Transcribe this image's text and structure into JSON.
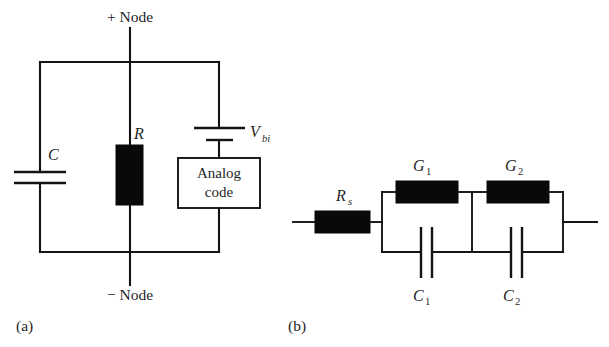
{
  "figure": {
    "subfigures": [
      {
        "id": "a",
        "label": "(a)"
      },
      {
        "id": "b",
        "label": "(b)"
      }
    ]
  },
  "circuit_a": {
    "caption": "(a)",
    "terminals": {
      "top": "+ Node",
      "bottom": "− Node"
    },
    "components": [
      {
        "name": "capacitor-c",
        "label": "C",
        "type": "capacitor",
        "orientation": "horizontal-plates"
      },
      {
        "name": "resistor-r",
        "label": "R",
        "type": "resistor",
        "style": "filled-block"
      },
      {
        "name": "source-vbi",
        "label": "V",
        "sub": "bi",
        "type": "voltage-source",
        "style": "battery"
      },
      {
        "name": "analog-code-block",
        "line1": "Analog",
        "line2": "code",
        "type": "block"
      }
    ]
  },
  "circuit_b": {
    "caption": "(b)",
    "components": [
      {
        "name": "resistor-rs",
        "label": "R",
        "sub": "s",
        "type": "resistor",
        "style": "filled-block"
      },
      {
        "name": "conductance-g1",
        "label": "G",
        "sub": "1",
        "type": "conductance",
        "style": "filled-block"
      },
      {
        "name": "conductance-g2",
        "label": "G",
        "sub": "2",
        "type": "conductance",
        "style": "filled-block"
      },
      {
        "name": "capacitor-c1",
        "label": "C",
        "sub": "1",
        "type": "capacitor",
        "orientation": "vertical-plates"
      },
      {
        "name": "capacitor-c2",
        "label": "C",
        "sub": "2",
        "type": "capacitor",
        "orientation": "vertical-plates"
      }
    ]
  },
  "colors": {
    "ink": "#141414",
    "fill_block": "#090909",
    "background": "#ffffff"
  }
}
